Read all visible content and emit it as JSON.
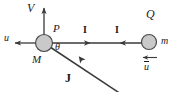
{
  "figure": {
    "type": "physics-vector-diagram",
    "background_color": "#ffffff",
    "line_color": "#3a3a3a",
    "body_fill_color": "#c9c9c9",
    "body_stroke_color": "#4a4a4a",
    "text_color": "#1a1a1a"
  },
  "labels": {
    "velocity_V": "V",
    "point_P": "P",
    "mass_M": "M",
    "velocity_u_left": "u",
    "angle_theta": "θ",
    "impulse_I_left": "I",
    "impulse_I_right": "I",
    "point_Q": "Q",
    "mass_m": "m",
    "velocity_u_right": "u",
    "impulse_J": "J"
  },
  "bodies": [
    {
      "name": "left-body",
      "label_top": "P",
      "label_bottom": "M",
      "cx": 44,
      "cy": 43,
      "r": 8.5
    },
    {
      "name": "right-body",
      "label_top": "Q",
      "label_right": "m",
      "cx": 149,
      "cy": 42,
      "r": 7.5
    }
  ],
  "vectors": [
    {
      "name": "velocity-V",
      "label": "V",
      "direction": "up",
      "from": [
        44,
        35
      ],
      "to": [
        44,
        6
      ]
    },
    {
      "name": "velocity-u-left",
      "label": "u",
      "direction": "left",
      "from": [
        36,
        43
      ],
      "to": [
        13,
        43
      ]
    },
    {
      "name": "impulse-I-left",
      "label": "I",
      "direction": "right",
      "from": [
        53,
        43
      ],
      "to": [
        92,
        43
      ]
    },
    {
      "name": "impulse-I-right",
      "label": "I",
      "direction": "left",
      "from": [
        141,
        43
      ],
      "to": [
        119,
        43
      ]
    },
    {
      "name": "velocity-u-right",
      "label": "u",
      "direction": "left",
      "from": [
        158,
        58
      ],
      "to": [
        141,
        58
      ]
    },
    {
      "name": "impulse-J",
      "label": "J",
      "direction": "up-left",
      "from": [
        120,
        92
      ],
      "to": [
        78,
        61
      ]
    }
  ],
  "angle": {
    "name": "theta",
    "symbol": "θ",
    "vertex": [
      44,
      43
    ],
    "between": [
      "impulse-I-left",
      "impulse-J"
    ]
  }
}
